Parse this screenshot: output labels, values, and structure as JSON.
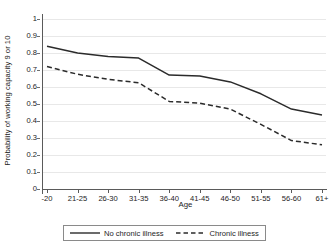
{
  "chart_data": {
    "type": "line",
    "title": "",
    "xlabel": "Age",
    "ylabel": "Probability of working capacity 9 or 10",
    "categories": [
      "-20",
      "21-25",
      "26-30",
      "31-35",
      "36-40",
      "41-45",
      "46-50",
      "51-55",
      "56-60",
      "61+"
    ],
    "ylim": [
      0,
      1
    ],
    "ytick_labels": [
      "0",
      "0.1",
      "0.2",
      "0.3",
      "0.4",
      "0.5",
      "0.6",
      "0.7",
      "0.8",
      "0.9",
      "1"
    ],
    "ytick_values": [
      0,
      0.1,
      0.2,
      0.3,
      0.4,
      0.5,
      0.6,
      0.7,
      0.8,
      0.9,
      1
    ],
    "grid": "horizontal",
    "legend_position": "bottom",
    "series": [
      {
        "name": "No chronic illness",
        "style": "solid",
        "color": "#2b2b2b",
        "values": [
          0.84,
          0.8,
          0.78,
          0.77,
          0.67,
          0.665,
          0.63,
          0.56,
          0.47,
          0.435
        ]
      },
      {
        "name": "Chronic illness",
        "style": "dashed",
        "color": "#2b2b2b",
        "values": [
          0.72,
          0.675,
          0.645,
          0.625,
          0.515,
          0.505,
          0.47,
          0.38,
          0.285,
          0.26
        ]
      }
    ]
  },
  "legend": {
    "entries": [
      {
        "label": "No chronic illness",
        "style": "solid"
      },
      {
        "label": "Chronic illness",
        "style": "dashed"
      }
    ]
  },
  "axes": {
    "x_title": "Age",
    "y_title": "Probability of working capacity 9 or 10"
  }
}
